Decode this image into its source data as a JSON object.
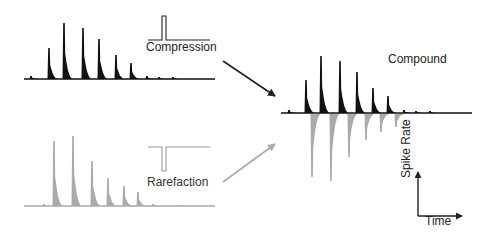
{
  "labels": {
    "compression": "Compression",
    "rarefaction": "Rarefaction",
    "compound": "Compound",
    "axis_y": "Spike Rate",
    "axis_x": "Time"
  },
  "colors": {
    "compression": "#111111",
    "rarefaction": "#aaaaaa",
    "arrow_dark": "#222222",
    "arrow_light": "#aaaaaa"
  },
  "traces": {
    "compression": {
      "baseline_y": 79,
      "x_start": 24,
      "x_end": 215,
      "peaks": [
        {
          "x": 31,
          "top": 76
        },
        {
          "x": 49,
          "top": 48
        },
        {
          "x": 64,
          "top": 23
        },
        {
          "x": 83,
          "top": 28
        },
        {
          "x": 99,
          "top": 39
        },
        {
          "x": 116,
          "top": 55
        },
        {
          "x": 131,
          "top": 63
        },
        {
          "x": 147,
          "top": 76
        },
        {
          "x": 159,
          "top": 77
        },
        {
          "x": 173,
          "top": 77
        }
      ]
    },
    "rarefaction": {
      "baseline_y": 206,
      "x_start": 24,
      "x_end": 215,
      "peaks": [
        {
          "x": 44,
          "top": 204
        },
        {
          "x": 54,
          "top": 141
        },
        {
          "x": 73,
          "top": 136
        },
        {
          "x": 92,
          "top": 161
        },
        {
          "x": 108,
          "top": 178
        },
        {
          "x": 124,
          "top": 186
        },
        {
          "x": 138,
          "top": 192
        },
        {
          "x": 153,
          "top": 204
        },
        {
          "x": 180,
          "top": 205
        }
      ]
    },
    "compound": {
      "baseline_y": 113,
      "x_start": 281,
      "x_end": 472,
      "up_peaks": [
        {
          "x": 289,
          "top": 110
        },
        {
          "x": 306,
          "top": 80
        },
        {
          "x": 321,
          "top": 56
        },
        {
          "x": 340,
          "top": 61
        },
        {
          "x": 357,
          "top": 72
        },
        {
          "x": 373,
          "top": 88
        },
        {
          "x": 388,
          "top": 96
        },
        {
          "x": 404,
          "top": 110
        },
        {
          "x": 416,
          "top": 111
        },
        {
          "x": 430,
          "top": 111
        }
      ],
      "down_peaks": [
        {
          "x": 312,
          "bottom": 177
        },
        {
          "x": 331,
          "bottom": 181
        },
        {
          "x": 349,
          "bottom": 157
        },
        {
          "x": 366,
          "bottom": 140
        },
        {
          "x": 381,
          "bottom": 132
        },
        {
          "x": 396,
          "bottom": 127
        }
      ]
    }
  },
  "stimuli": {
    "compression": {
      "baseline_y": 40,
      "x_start": 148,
      "x_end": 210,
      "pulse_x": 162,
      "pulse_w": 4,
      "pulse_top": 16
    },
    "rarefaction": {
      "baseline_y": 147,
      "x_start": 148,
      "x_end": 210,
      "pulse_x": 162,
      "pulse_w": 4,
      "pulse_bottom": 171
    }
  }
}
